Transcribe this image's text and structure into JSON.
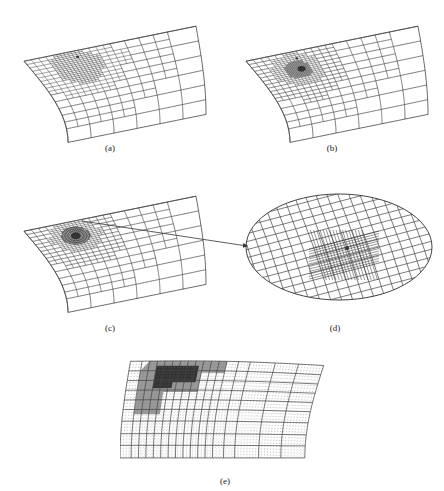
{
  "figure": {
    "panels": [
      {
        "id": "a",
        "caption": "(a)",
        "caption_pos": [
          95,
          143
        ],
        "box": [
          10,
          8,
          200,
          140
        ],
        "refinement": "single_marker",
        "dense_levels": 2
      },
      {
        "id": "b",
        "caption": "(b)",
        "caption_pos": [
          317,
          143
        ],
        "box": [
          232,
          8,
          200,
          140
        ],
        "refinement": "patch",
        "dense_levels": 2
      },
      {
        "id": "c",
        "caption": "(c)",
        "caption_pos": [
          95,
          323
        ],
        "box": [
          10,
          178,
          200,
          140
        ],
        "refinement": "focused_circle",
        "dense_levels": 3
      },
      {
        "id": "d",
        "caption": "(d)",
        "caption_pos": [
          320,
          323
        ],
        "box": [
          244,
          192,
          190,
          110
        ],
        "refinement": "zoomed_ellipse"
      },
      {
        "id": "e",
        "caption": "(e)",
        "caption_pos": [
          210,
          476
        ],
        "box": [
          120,
          355,
          210,
          105
        ],
        "refinement": "region_fine"
      }
    ],
    "arrow": {
      "from": [
        82,
        221
      ],
      "to": [
        247,
        246
      ]
    },
    "colors": {
      "line": "#444444",
      "dense": "#333333",
      "background": "#ffffff",
      "text": "#222222"
    }
  }
}
